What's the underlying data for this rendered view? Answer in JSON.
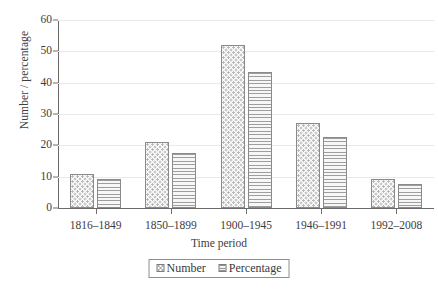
{
  "chart_data": {
    "type": "bar",
    "title": "",
    "xlabel": "Time period",
    "ylabel": "Number / percentage",
    "categories": [
      "1816–1849",
      "1850–1899",
      "1900–1945",
      "1946–1991",
      "1992–2008"
    ],
    "series": [
      {
        "name": "Number",
        "values": [
          11,
          21,
          52,
          27,
          9.2
        ],
        "pattern": "checkered-dots"
      },
      {
        "name": "Percentage",
        "values": [
          9.2,
          17.6,
          43.5,
          22.7,
          7.8
        ],
        "pattern": "horizontal-stripes"
      }
    ],
    "ylim": [
      0,
      60
    ],
    "yticks": [
      0,
      10,
      20,
      30,
      40,
      50,
      60
    ],
    "ytick_labels": [
      "0",
      "10",
      "20",
      "30",
      "40",
      "50",
      "60"
    ],
    "grid": true,
    "grid_axis": "y",
    "legend_position": "below-center",
    "colors": {
      "bar_border": "#8a8a8a",
      "gridline": "#e9e9e9",
      "axis": "#6a6a6a",
      "text": "#3d3d3d",
      "background": "#ffffff"
    }
  },
  "legend": {
    "items": [
      {
        "label": "Number"
      },
      {
        "label": "Percentage"
      }
    ]
  }
}
